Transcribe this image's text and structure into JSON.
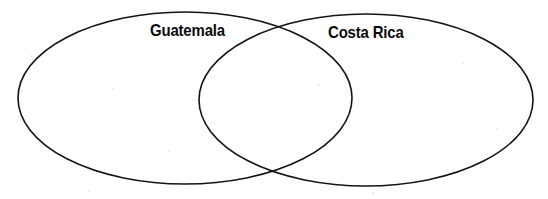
{
  "diagram": {
    "type": "venn",
    "set_count": 2,
    "background_color": "#ffffff",
    "stroke_color": "#141414",
    "label_color": "#0b0b0b",
    "sets": [
      {
        "id": "left",
        "label": "Guatemala",
        "cx": 185,
        "cy": 98,
        "rx": 167,
        "ry": 86
      },
      {
        "id": "right",
        "label": "Costa Rica",
        "cx": 366,
        "cy": 100,
        "rx": 167,
        "ry": 86
      }
    ],
    "regions": {
      "left_only_text": "",
      "overlap_text": "",
      "right_only_text": ""
    }
  }
}
